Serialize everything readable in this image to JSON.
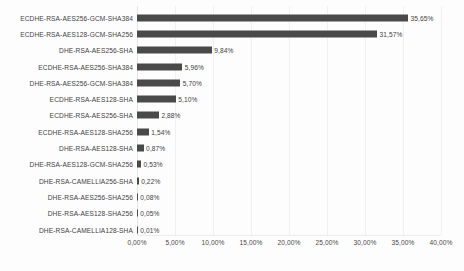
{
  "chart_data": {
    "type": "bar",
    "orientation": "horizontal",
    "title": "",
    "xlabel": "",
    "ylabel": "",
    "xlim": [
      0,
      40
    ],
    "grid": true,
    "legend": false,
    "value_suffix": "%",
    "decimal_separator": ",",
    "categories": [
      "ECDHE-RSA-AES256-GCM-SHA384",
      "ECDHE-RSA-AES128-GCM-SHA256",
      "DHE-RSA-AES256-SHA",
      "ECDHE-RSA-AES256-SHA384",
      "DHE-RSA-AES256-GCM-SHA384",
      "ECDHE-RSA-AES128-SHA",
      "ECDHE-RSA-AES256-SHA",
      "ECDHE-RSA-AES128-SHA256",
      "DHE-RSA-AES128-SHA",
      "DHE-RSA-AES128-GCM-SHA256",
      "DHE-RSA-CAMELLIA256-SHA",
      "DHE-RSA-AES256-SHA256",
      "DHE-RSA-AES128-SHA256",
      "DHE-RSA-CAMELLIA128-SHA"
    ],
    "values": [
      35.65,
      31.57,
      9.84,
      5.96,
      5.7,
      5.1,
      2.88,
      1.54,
      0.87,
      0.53,
      0.22,
      0.08,
      0.05,
      0.01
    ],
    "value_labels": [
      "35,65%",
      "31,57%",
      "9,84%",
      "5,96%",
      "5,70%",
      "5,10%",
      "2,88%",
      "1,54%",
      "0,87%",
      "0,53%",
      "0,22%",
      "0,08%",
      "0,05%",
      "0,01%"
    ],
    "xticks": [
      0,
      5,
      10,
      15,
      20,
      25,
      30,
      35,
      40
    ],
    "xtick_labels": [
      "0,00%",
      "5,00%",
      "10,00%",
      "15,00%",
      "20,00%",
      "25,00%",
      "30,00%",
      "35,00%",
      "40,00%"
    ],
    "bar_color": "#4a4a4a",
    "grid_color": "#f0f0f0",
    "text_color": "#3f3f3f",
    "background_color": "#fdfdfd"
  }
}
